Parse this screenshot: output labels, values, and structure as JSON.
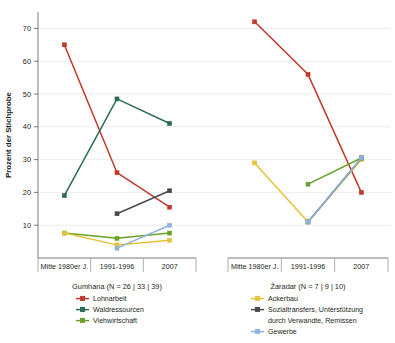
{
  "chart_data": {
    "type": "line",
    "title": "",
    "ylabel": "Prozent der Stichprobe",
    "xlabel": "",
    "ylim": [
      0,
      75
    ],
    "yticks": [
      10,
      20,
      30,
      40,
      50,
      60,
      70
    ],
    "ytick_labels": [
      "10",
      "20",
      "30",
      "40",
      "50",
      "60",
      "70"
    ],
    "grid": true,
    "legend_position": "below",
    "categories": [
      "Mitte 1980er J.",
      "1991-1996",
      "2007"
    ],
    "panels": [
      {
        "name": "Gumhana",
        "caption": "Gumhana (N = 26 | 33 | 39)",
        "series": [
          {
            "name": "Lohnarbeit",
            "color": "#c0392b",
            "values": [
              65,
              26,
              15.5
            ]
          },
          {
            "name": "Waldressourcen",
            "color": "#2f6b52",
            "values": [
              19,
              48.5,
              41
            ]
          },
          {
            "name": "Viehwirtschaft",
            "color": "#6aa02c",
            "values": [
              7.6,
              6,
              7.6
            ]
          },
          {
            "name": "Ackerbau",
            "color": "#e4c23c",
            "values": [
              7.6,
              4,
              5.4
            ]
          },
          {
            "name": "Sozialtransfers, Unterstützung durch Verwandte, Remissen",
            "color": "#4a4a4a",
            "values": [
              null,
              13.5,
              20.5
            ]
          },
          {
            "name": "Gewerbe",
            "color": "#8fb3dd",
            "values": [
              null,
              3,
              10
            ]
          }
        ]
      },
      {
        "name": "Žaradar",
        "caption": "Žaradar (N = 7 | 9 | 10)",
        "series": [
          {
            "name": "Lohnarbeit",
            "color": "#c0392b",
            "values": [
              72,
              56,
              20
            ]
          },
          {
            "name": "Ackerbau",
            "color": "#e4c23c",
            "values": [
              29,
              11,
              30
            ]
          },
          {
            "name": "Viehwirtschaft",
            "color": "#6aa02c",
            "values": [
              null,
              22.5,
              30.5
            ]
          },
          {
            "name": "Sozialtransfers, Unterstützung durch Verwandte, Remissen",
            "color": "#4a4a4a",
            "values": [
              null,
              11,
              30.5
            ]
          },
          {
            "name": "Gewerbe",
            "color": "#8fb3dd",
            "values": [
              null,
              11,
              30.5
            ]
          }
        ]
      }
    ]
  },
  "axis": {
    "y_title": "Prozent der Stichprobe",
    "y_ticks": [
      "70",
      "60",
      "50",
      "40",
      "30",
      "20",
      "10"
    ],
    "x_categories_left": [
      "Mitte 1980er J.",
      "1991-1996",
      "2007"
    ],
    "x_categories_right": [
      "Mitte 1980er J.",
      "1991-1996",
      "2007"
    ]
  },
  "legend_left": {
    "title": "Gumhana (N = 26 | 33 | 39)",
    "items": [
      {
        "label": "Lohnarbeit",
        "color": "#c0392b"
      },
      {
        "label": "Waldressourcen",
        "color": "#2f6b52"
      },
      {
        "label": "Viehwirtschaft",
        "color": "#6aa02c"
      }
    ]
  },
  "legend_right": {
    "title": "Žaradar (N = 7 | 9 | 10)",
    "items": [
      {
        "label": "Ackerbau",
        "color": "#e4c23c",
        "line2": ""
      },
      {
        "label": "Sozialtransfers, Unterstützung",
        "line2": "durch Verwandte, Remissen",
        "color": "#4a4a4a"
      },
      {
        "label": "Gewerbe",
        "color": "#8fb3dd",
        "line2": ""
      }
    ]
  }
}
